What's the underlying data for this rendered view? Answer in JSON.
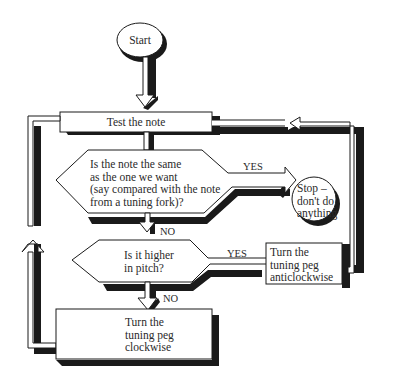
{
  "diagram": {
    "type": "flowchart",
    "nodes": {
      "start": {
        "shape": "oval",
        "label": "Start"
      },
      "test": {
        "shape": "process",
        "label": "Test the note"
      },
      "same": {
        "shape": "decision",
        "lines": [
          "Is the note the same",
          "as the one we want",
          "(say compared with the note",
          "from a tuning fork)?"
        ]
      },
      "stop": {
        "shape": "circle",
        "lines": [
          "Stop –",
          "don't do",
          "anything"
        ]
      },
      "higher": {
        "shape": "decision",
        "lines": [
          "Is it higher",
          "in pitch?"
        ]
      },
      "anticlockwise": {
        "shape": "process",
        "lines": [
          "Turn the",
          "tuning peg",
          "anticlockwise"
        ]
      },
      "clockwise": {
        "shape": "process",
        "lines": [
          "Turn the",
          "tuning peg",
          "clockwise"
        ]
      }
    },
    "edge_labels": {
      "same_yes": "YES",
      "same_no": "NO",
      "higher_yes": "YES",
      "higher_no": "NO"
    },
    "edges": [
      {
        "from": "start",
        "to": "test"
      },
      {
        "from": "test",
        "to": "same"
      },
      {
        "from": "same",
        "to": "stop",
        "label": "YES"
      },
      {
        "from": "same",
        "to": "higher",
        "label": "NO"
      },
      {
        "from": "higher",
        "to": "anticlockwise",
        "label": "YES"
      },
      {
        "from": "higher",
        "to": "clockwise",
        "label": "NO"
      },
      {
        "from": "anticlockwise",
        "to": "test"
      },
      {
        "from": "clockwise",
        "to": "test"
      }
    ],
    "colors": {
      "ink": "#1a1a1a",
      "fill": "#ffffff"
    }
  }
}
